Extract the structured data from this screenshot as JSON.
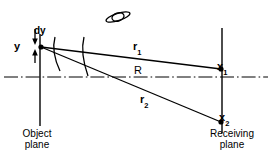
{
  "diagram": {
    "colors": {
      "stroke": "#000000",
      "background": "#ffffff"
    },
    "labels": {
      "source_height": "y",
      "differential_element": "dy",
      "ray_upper": "r",
      "ray_upper_sub": "1",
      "ray_lower": "r",
      "ray_lower_sub": "2",
      "axis_distance": "R",
      "point_upper": "x",
      "point_upper_sub": "1",
      "point_lower": "x",
      "point_lower_sub": "2",
      "object_plane_line1": "Object",
      "object_plane_line2": "plane",
      "receiving_plane_line1": "Receiving",
      "receiving_plane_line2": "plane"
    },
    "icons": {
      "object_icon": "saturn-object-icon",
      "origin_point": "source-point-dot",
      "point_x1": "receiving-point-dot-x1",
      "point_x2": "receiving-point-dot-x2"
    },
    "geometry": {
      "object_plane_x": 40,
      "receiving_plane_x": 222,
      "optical_axis_y": 77,
      "source_y": 47,
      "x1_y": 69,
      "x2_y": 122,
      "object_plane_top": 34,
      "object_plane_bottom": 126,
      "receiving_plane_top": 28,
      "receiving_plane_bottom": 133
    }
  }
}
